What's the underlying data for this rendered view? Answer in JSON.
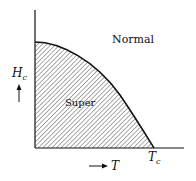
{
  "diagram": {
    "regions": {
      "normal": "Normal",
      "super": "Super"
    },
    "axes": {
      "y_label": "H",
      "y_sub": "c",
      "x_label": "T",
      "x_tick": "T",
      "x_tick_sub": "c"
    },
    "colors": {
      "line": "#111111",
      "hatch": "#333333",
      "background": "#ffffff"
    }
  }
}
